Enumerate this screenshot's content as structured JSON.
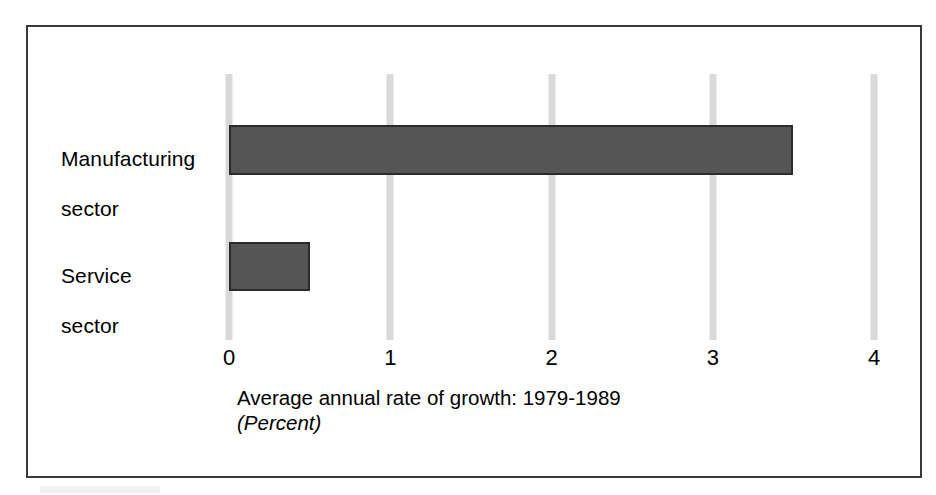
{
  "chart_data": {
    "type": "bar",
    "orientation": "horizontal",
    "title": "",
    "subtitle": "",
    "categories": [
      "Manufacturing sector",
      "Service sector"
    ],
    "category_label_lines": [
      [
        "Manufacturing",
        "sector"
      ],
      [
        "Service",
        "sector"
      ]
    ],
    "values": [
      3.5,
      0.5
    ],
    "series": [
      {
        "name": "Average annual rate of growth: 1979-1989",
        "values": [
          3.5,
          0.5
        ]
      }
    ],
    "xlabel": "Average annual rate of growth: 1979-1989",
    "xlabel_unit": "(Percent)",
    "ylabel": "",
    "xlim": [
      0,
      4
    ],
    "xticks": [
      0,
      1,
      2,
      3,
      4
    ],
    "xtick_labels": [
      "0",
      "1",
      "2",
      "3",
      "4"
    ],
    "grid": true,
    "grid_axis": "x",
    "legend": false,
    "legend_position": "none",
    "bar_color": "#555555",
    "bar_border_color": "#2b2b2b",
    "gridline_color": "#d9d9d9",
    "frame_color": "#3a3a3a",
    "background_color": "#ffffff"
  },
  "figure": {
    "caption_main": "Average annual rate of growth: 1979-1989",
    "caption_unit": "(Percent)"
  }
}
